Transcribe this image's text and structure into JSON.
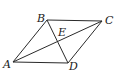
{
  "diagram": {
    "type": "parallelogram-with-diagonals",
    "vertices": {
      "A": {
        "label": "A",
        "x": 13,
        "y": 62,
        "label_x": 3,
        "label_y": 68
      },
      "B": {
        "label": "B",
        "x": 47,
        "y": 20,
        "label_x": 37,
        "label_y": 22
      },
      "C": {
        "label": "C",
        "x": 102,
        "y": 21,
        "label_x": 105,
        "label_y": 24
      },
      "D": {
        "label": "D",
        "x": 68,
        "y": 63,
        "label_x": 69,
        "label_y": 70
      },
      "E": {
        "label": "E",
        "x": 57.5,
        "y": 41.5,
        "label_x": 58,
        "label_y": 36
      }
    },
    "segments": [
      [
        "A",
        "B"
      ],
      [
        "B",
        "C"
      ],
      [
        "C",
        "D"
      ],
      [
        "D",
        "A"
      ],
      [
        "A",
        "C"
      ],
      [
        "B",
        "D"
      ]
    ],
    "stroke_color": "#2a2a2a",
    "label_color": "#1a1a1a"
  }
}
